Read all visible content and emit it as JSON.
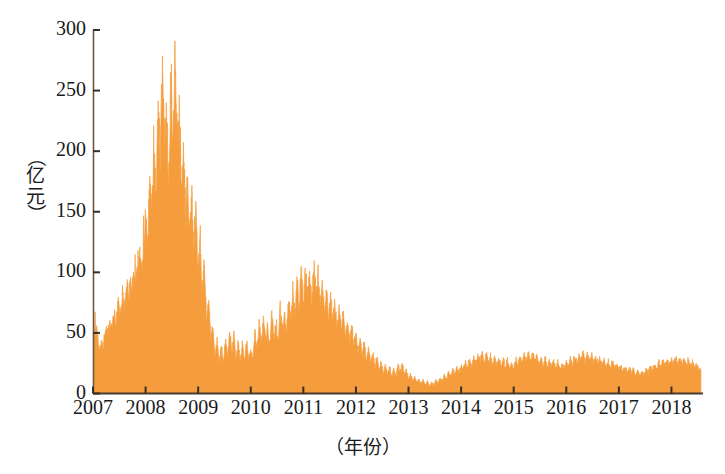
{
  "chart_data": {
    "type": "area",
    "title": "",
    "xlabel": "（年份）",
    "ylabel": "（亿元）",
    "xlabel_text": "（年份）",
    "ylabel_chars": [
      "（",
      "亿",
      "元",
      "）"
    ],
    "ylabel_paren_open": "（",
    "ylabel_paren_close": "）",
    "ylabel_ch1": "亿",
    "ylabel_ch2": "元",
    "series_name": "成交额",
    "color": "#F59D3D",
    "edge_color": "#F08A2A",
    "axis_color": "#5a4632",
    "background": "#FFFFFF",
    "grid": false,
    "legend": null,
    "xlim": [
      2007,
      2018.6
    ],
    "ylim": [
      0,
      300
    ],
    "yticks": [
      0,
      50,
      100,
      150,
      200,
      250,
      300
    ],
    "ytick_labels": [
      "0",
      "50",
      "100",
      "150",
      "200",
      "250",
      "300"
    ],
    "xticks": [
      2007,
      2008,
      2009,
      2010,
      2011,
      2012,
      2013,
      2014,
      2015,
      2016,
      2017,
      2018
    ],
    "xtick_labels": [
      "2007",
      "2008",
      "2009",
      "2010",
      "2011",
      "2012",
      "2013",
      "2014",
      "2015",
      "2016",
      "2017",
      "2018"
    ],
    "x": [
      2007.0,
      2007.04,
      2007.08,
      2007.12,
      2007.16,
      2007.2,
      2007.24,
      2007.28,
      2007.32,
      2007.36,
      2007.4,
      2007.44,
      2007.48,
      2007.52,
      2007.56,
      2007.6,
      2007.64,
      2007.68,
      2007.72,
      2007.76,
      2007.8,
      2007.84,
      2007.88,
      2007.92,
      2007.96,
      2008.0,
      2008.04,
      2008.08,
      2008.12,
      2008.16,
      2008.2,
      2008.24,
      2008.28,
      2008.32,
      2008.36,
      2008.4,
      2008.44,
      2008.48,
      2008.52,
      2008.56,
      2008.6,
      2008.64,
      2008.68,
      2008.72,
      2008.76,
      2008.8,
      2008.84,
      2008.88,
      2008.92,
      2008.96,
      2009.0,
      2009.04,
      2009.08,
      2009.12,
      2009.16,
      2009.2,
      2009.24,
      2009.28,
      2009.32,
      2009.36,
      2009.4,
      2009.44,
      2009.48,
      2009.52,
      2009.56,
      2009.6,
      2009.64,
      2009.68,
      2009.72,
      2009.76,
      2009.8,
      2009.84,
      2009.88,
      2009.92,
      2009.96,
      2010.0,
      2010.04,
      2010.08,
      2010.12,
      2010.16,
      2010.2,
      2010.24,
      2010.28,
      2010.32,
      2010.36,
      2010.4,
      2010.44,
      2010.48,
      2010.52,
      2010.56,
      2010.6,
      2010.64,
      2010.68,
      2010.72,
      2010.76,
      2010.8,
      2010.84,
      2010.88,
      2010.92,
      2010.96,
      2011.0,
      2011.04,
      2011.08,
      2011.12,
      2011.16,
      2011.2,
      2011.24,
      2011.28,
      2011.32,
      2011.36,
      2011.4,
      2011.44,
      2011.48,
      2011.52,
      2011.56,
      2011.6,
      2011.64,
      2011.68,
      2011.72,
      2011.76,
      2011.8,
      2011.84,
      2011.88,
      2011.92,
      2011.96,
      2012.0,
      2012.04,
      2012.08,
      2012.12,
      2012.16,
      2012.2,
      2012.24,
      2012.28,
      2012.32,
      2012.36,
      2012.4,
      2012.44,
      2012.48,
      2012.52,
      2012.56,
      2012.6,
      2012.64,
      2012.68,
      2012.72,
      2012.76,
      2012.8,
      2012.84,
      2012.88,
      2012.92,
      2012.96,
      2013.0,
      2013.04,
      2013.08,
      2013.12,
      2013.16,
      2013.2,
      2013.24,
      2013.28,
      2013.32,
      2013.36,
      2013.4,
      2013.44,
      2013.48,
      2013.52,
      2013.56,
      2013.6,
      2013.64,
      2013.68,
      2013.72,
      2013.76,
      2013.8,
      2013.84,
      2013.88,
      2013.92,
      2013.96,
      2014.0,
      2014.04,
      2014.08,
      2014.12,
      2014.16,
      2014.2,
      2014.24,
      2014.28,
      2014.32,
      2014.36,
      2014.4,
      2014.44,
      2014.48,
      2014.52,
      2014.56,
      2014.6,
      2014.64,
      2014.68,
      2014.72,
      2014.76,
      2014.8,
      2014.84,
      2014.88,
      2014.92,
      2014.96,
      2015.0,
      2015.04,
      2015.08,
      2015.12,
      2015.16,
      2015.2,
      2015.24,
      2015.28,
      2015.32,
      2015.36,
      2015.4,
      2015.44,
      2015.48,
      2015.52,
      2015.56,
      2015.6,
      2015.64,
      2015.68,
      2015.72,
      2015.76,
      2015.8,
      2015.84,
      2015.88,
      2015.92,
      2015.96,
      2016.0,
      2016.04,
      2016.08,
      2016.12,
      2016.16,
      2016.2,
      2016.24,
      2016.28,
      2016.32,
      2016.36,
      2016.4,
      2016.44,
      2016.48,
      2016.52,
      2016.56,
      2016.6,
      2016.64,
      2016.68,
      2016.72,
      2016.76,
      2016.8,
      2016.84,
      2016.88,
      2016.92,
      2016.96,
      2017.0,
      2017.04,
      2017.08,
      2017.12,
      2017.16,
      2017.2,
      2017.24,
      2017.28,
      2017.32,
      2017.36,
      2017.4,
      2017.44,
      2017.48,
      2017.52,
      2017.56,
      2017.6,
      2017.64,
      2017.68,
      2017.72,
      2017.76,
      2017.8,
      2017.84,
      2017.88,
      2017.92,
      2017.96,
      2018.0,
      2018.04,
      2018.08,
      2018.12,
      2018.16,
      2018.2,
      2018.24,
      2018.28,
      2018.32,
      2018.36,
      2018.4,
      2018.44,
      2018.48,
      2018.52,
      2018.56
    ],
    "values": [
      30,
      62,
      48,
      36,
      42,
      38,
      55,
      47,
      60,
      52,
      68,
      58,
      74,
      62,
      80,
      70,
      88,
      78,
      96,
      86,
      104,
      95,
      116,
      102,
      128,
      140,
      118,
      175,
      150,
      205,
      168,
      240,
      190,
      272,
      200,
      230,
      176,
      262,
      196,
      274,
      210,
      238,
      168,
      196,
      150,
      172,
      135,
      158,
      122,
      150,
      100,
      128,
      82,
      108,
      60,
      80,
      46,
      56,
      30,
      44,
      26,
      38,
      24,
      46,
      30,
      52,
      34,
      48,
      28,
      44,
      26,
      40,
      27,
      42,
      30,
      34,
      28,
      50,
      36,
      58,
      40,
      62,
      44,
      56,
      38,
      64,
      46,
      58,
      42,
      70,
      50,
      66,
      48,
      78,
      58,
      86,
      64,
      92,
      70,
      105,
      74,
      98,
      80,
      92,
      72,
      102,
      78,
      95,
      72,
      88,
      66,
      84,
      62,
      78,
      58,
      74,
      54,
      70,
      50,
      66,
      46,
      60,
      42,
      54,
      38,
      50,
      34,
      46,
      30,
      42,
      27,
      38,
      24,
      34,
      21,
      30,
      19,
      26,
      17,
      24,
      15,
      22,
      14,
      20,
      13,
      26,
      18,
      24,
      16,
      20,
      12,
      16,
      10,
      14,
      9,
      12,
      8,
      11,
      7,
      10,
      6,
      9,
      7,
      11,
      9,
      13,
      10,
      15,
      12,
      18,
      14,
      20,
      16,
      22,
      17,
      24,
      19,
      26,
      20,
      28,
      22,
      30,
      24,
      32,
      25,
      34,
      26,
      33,
      25,
      31,
      24,
      30,
      23,
      29,
      22,
      28,
      21,
      27,
      20,
      26,
      21,
      28,
      23,
      30,
      25,
      32,
      26,
      34,
      27,
      33,
      26,
      31,
      24,
      29,
      23,
      28,
      22,
      27,
      21,
      26,
      20,
      25,
      19,
      24,
      20,
      26,
      22,
      28,
      24,
      30,
      25,
      32,
      26,
      34,
      27,
      33,
      26,
      31,
      25,
      30,
      24,
      29,
      23,
      28,
      22,
      26,
      21,
      25,
      20,
      24,
      19,
      23,
      18,
      22,
      17,
      21,
      16,
      20,
      15,
      19,
      14,
      18,
      15,
      20,
      17,
      22,
      19,
      24,
      20,
      26,
      21,
      27,
      22,
      28,
      23,
      29,
      24,
      30,
      25,
      29,
      24,
      28,
      23,
      27,
      22,
      26,
      21,
      25,
      20,
      19
    ],
    "annotations": []
  }
}
